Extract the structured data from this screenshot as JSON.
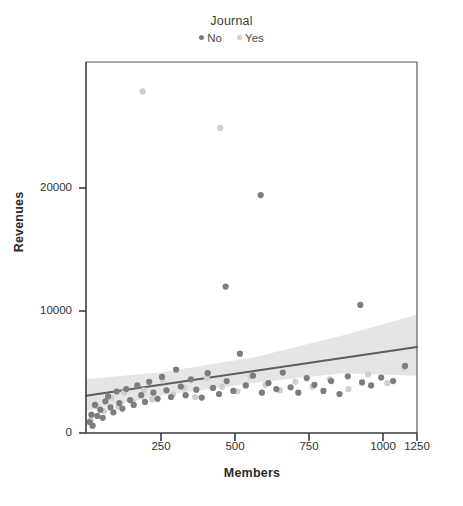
{
  "legend": {
    "title": "Journal",
    "entries": [
      {
        "label": "No",
        "color": "#7d7d7d",
        "marker": "legend-dot-no"
      },
      {
        "label": "Yes",
        "color": "#cfcfcf",
        "marker": "legend-dot-yes"
      }
    ]
  },
  "axes": {
    "x_title": "Members",
    "y_title": "Revenues",
    "x_ticks": [
      "250",
      "500",
      "750",
      "1000",
      "1250"
    ],
    "y_ticks": [
      "0",
      "10000",
      "20000"
    ]
  },
  "chart_data": {
    "type": "scatter",
    "title": "",
    "xlabel": "Members",
    "ylabel": "Revenues",
    "xlim": [
      140,
      1250
    ],
    "ylim": [
      0,
      28500
    ],
    "x_ticks": [
      250,
      500,
      750,
      1000,
      1250
    ],
    "y_ticks": [
      0,
      10000,
      20000
    ],
    "grid": false,
    "legend": {
      "title": "Journal",
      "position": "top-center"
    },
    "colors": {
      "no": "#7d7d7d",
      "yes": "#cfcfcf",
      "fit_line": "#5f5f5f",
      "ci_band": "#e3e3e3"
    },
    "series": [
      {
        "name": "No",
        "color": "#7d7d7d",
        "points": [
          [
            152,
            900
          ],
          [
            158,
            1500
          ],
          [
            162,
            600
          ],
          [
            170,
            2300
          ],
          [
            178,
            1400
          ],
          [
            188,
            1900
          ],
          [
            196,
            1250
          ],
          [
            205,
            2600
          ],
          [
            214,
            3000
          ],
          [
            222,
            2100
          ],
          [
            232,
            1700
          ],
          [
            243,
            3400
          ],
          [
            252,
            2450
          ],
          [
            262,
            2000
          ],
          [
            275,
            3600
          ],
          [
            288,
            2700
          ],
          [
            300,
            2300
          ],
          [
            312,
            3900
          ],
          [
            325,
            3100
          ],
          [
            338,
            2550
          ],
          [
            352,
            4200
          ],
          [
            366,
            3300
          ],
          [
            380,
            2800
          ],
          [
            395,
            4600
          ],
          [
            410,
            3500
          ],
          [
            425,
            2950
          ],
          [
            442,
            5200
          ],
          [
            458,
            3800
          ],
          [
            474,
            3100
          ],
          [
            492,
            4400
          ],
          [
            510,
            3550
          ],
          [
            528,
            2900
          ],
          [
            548,
            4900
          ],
          [
            566,
            3700
          ],
          [
            586,
            3200
          ],
          [
            608,
            12000
          ],
          [
            612,
            4250
          ],
          [
            634,
            3450
          ],
          [
            656,
            6500
          ],
          [
            676,
            3900
          ],
          [
            700,
            4700
          ],
          [
            726,
            19500
          ],
          [
            730,
            3300
          ],
          [
            752,
            4100
          ],
          [
            778,
            3600
          ],
          [
            800,
            4950
          ],
          [
            826,
            3750
          ],
          [
            852,
            3300
          ],
          [
            880,
            4500
          ],
          [
            906,
            3950
          ],
          [
            936,
            3450
          ],
          [
            962,
            4250
          ],
          [
            990,
            3200
          ],
          [
            1018,
            4650
          ],
          [
            1060,
            10500
          ],
          [
            1066,
            4150
          ],
          [
            1096,
            3900
          ],
          [
            1130,
            4550
          ],
          [
            1170,
            4250
          ],
          [
            1210,
            5500
          ]
        ]
      },
      {
        "name": "Yes",
        "color": "#cfcfcf",
        "points": [
          [
            156,
            1100
          ],
          [
            176,
            2200
          ],
          [
            200,
            1800
          ],
          [
            226,
            2900
          ],
          [
            248,
            2150
          ],
          [
            268,
            3300
          ],
          [
            296,
            2600
          ],
          [
            330,
            28000
          ],
          [
            334,
            3500
          ],
          [
            362,
            2750
          ],
          [
            398,
            4300
          ],
          [
            432,
            3150
          ],
          [
            470,
            3700
          ],
          [
            506,
            2950
          ],
          [
            545,
            4500
          ],
          [
            590,
            25000
          ],
          [
            596,
            3800
          ],
          [
            648,
            3400
          ],
          [
            692,
            4650
          ],
          [
            742,
            3950
          ],
          [
            790,
            3500
          ],
          [
            842,
            4200
          ],
          [
            900,
            3800
          ],
          [
            958,
            4400
          ],
          [
            1020,
            3600
          ],
          [
            1086,
            4800
          ],
          [
            1150,
            4100
          ],
          [
            1206,
            5300
          ]
        ]
      }
    ],
    "fit_line": {
      "name": "linear-regression",
      "x_start": 140,
      "y_start": 3050,
      "x_end": 1250,
      "y_end": 7050,
      "ci_band": {
        "x": [
          140,
          400,
          700,
          1000,
          1250
        ],
        "upper": [
          4400,
          5000,
          6200,
          8000,
          9700
        ],
        "lower": [
          1800,
          3100,
          4100,
          4900,
          4700
        ]
      }
    }
  }
}
